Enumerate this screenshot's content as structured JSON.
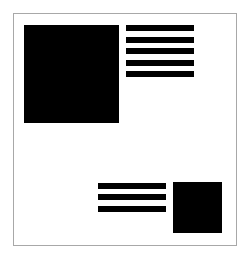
{
  "diagram": {
    "title": "",
    "colors": {
      "background": "#ffffff",
      "border": "#a8a8a8",
      "shapes": "#000000"
    },
    "elements": [
      {
        "id": "image-large",
        "type": "image-block",
        "x": 24,
        "y": 25,
        "w": 95,
        "h": 98
      },
      {
        "id": "text-top",
        "type": "text-lines",
        "x": 126,
        "w": 68,
        "rows": [
          25,
          37,
          48,
          60,
          71
        ],
        "line_height": 6
      },
      {
        "id": "text-bottom",
        "type": "text-lines",
        "x": 98,
        "w": 68,
        "rows": [
          183,
          194,
          206
        ],
        "line_height": 6
      },
      {
        "id": "image-small",
        "type": "image-block",
        "x": 173,
        "y": 182,
        "w": 49,
        "h": 51
      }
    ]
  }
}
